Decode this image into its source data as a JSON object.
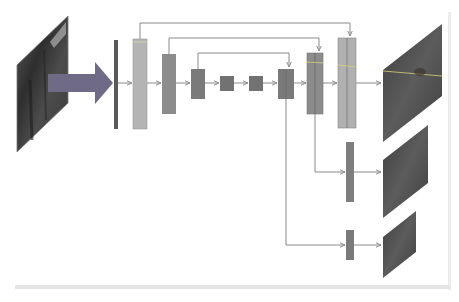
{
  "diagram": {
    "type": "encoder-decoder-network",
    "colors": {
      "background": "#ffffff",
      "input_arrow": "#6f6a86",
      "input_plane": "#3c3c3c",
      "bar_thin": "#5a5a5a",
      "block_light": "#b4b4b4",
      "block_mid": "#8c8c8c",
      "block_dark": "#7a7a7a",
      "output_plane": "#4a4a4a",
      "connector": "#8a8a8a",
      "highlight_line": "#d8d27a",
      "frame": "#e6e6e6"
    },
    "input": {
      "name": "input-image",
      "label": ""
    },
    "encoder_blocks": [
      {
        "id": "bar",
        "x": 114,
        "y": 40,
        "w": 4,
        "h": 89,
        "shade": "bar_thin"
      },
      {
        "id": "enc1",
        "x": 133,
        "y": 39,
        "w": 14,
        "h": 90,
        "shade": "block_light"
      },
      {
        "id": "enc2",
        "x": 162,
        "y": 54,
        "w": 14,
        "h": 60,
        "shade": "block_mid"
      },
      {
        "id": "enc3",
        "x": 191,
        "y": 69,
        "w": 14,
        "h": 30,
        "shade": "block_dark"
      },
      {
        "id": "bottleneck1",
        "x": 220,
        "y": 76,
        "w": 14,
        "h": 15,
        "shade": "block_dark"
      },
      {
        "id": "bottleneck2",
        "x": 249,
        "y": 76,
        "w": 14,
        "h": 15,
        "shade": "block_dark"
      }
    ],
    "decoder_blocks": [
      {
        "id": "dec3",
        "x": 278,
        "y": 69,
        "w": 16,
        "h": 30,
        "shade": "block_dark"
      },
      {
        "id": "dec2",
        "x": 307,
        "y": 53,
        "w": 16,
        "h": 61,
        "shade": "block_mid"
      },
      {
        "id": "dec1",
        "x": 338,
        "y": 38,
        "w": 18,
        "h": 90,
        "shade": "block_light"
      }
    ],
    "side_heads": [
      {
        "id": "head-mid",
        "x": 346,
        "y": 142,
        "w": 8,
        "h": 60
      },
      {
        "id": "head-small",
        "x": 346,
        "y": 230,
        "w": 8,
        "h": 30
      }
    ],
    "outputs": [
      {
        "id": "output-full",
        "label": ""
      },
      {
        "id": "output-mid",
        "label": ""
      },
      {
        "id": "output-small",
        "label": ""
      }
    ],
    "caption": ""
  }
}
